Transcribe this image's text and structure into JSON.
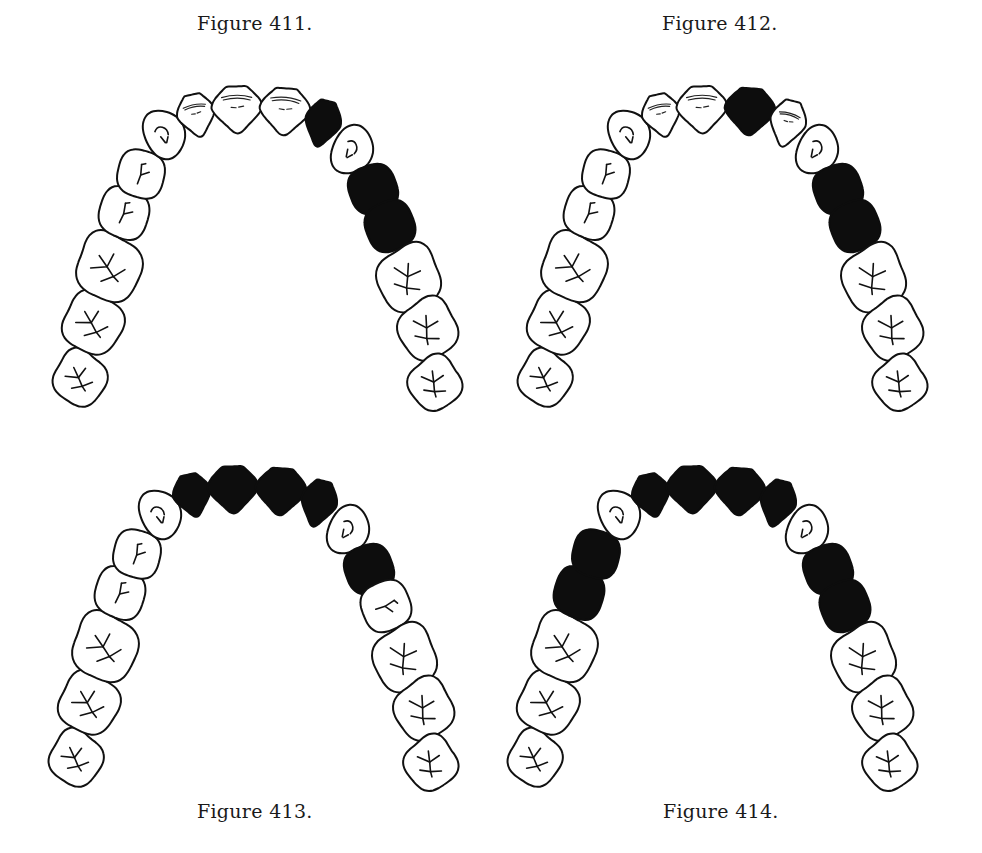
{
  "figures": [
    {
      "id": "fig411",
      "caption": "Figure 411.",
      "caption_pos": {
        "x": 197,
        "y": 12
      },
      "offset": {
        "x": 0,
        "y": 0
      },
      "filled": [
        "R-lateral",
        "R-pm1",
        "R-pm2"
      ]
    },
    {
      "id": "fig412",
      "caption": "Figure 412.",
      "caption_pos": {
        "x": 662,
        "y": 12
      },
      "offset": {
        "x": 465,
        "y": 0
      },
      "filled": [
        "R-central",
        "R-pm1",
        "R-pm2"
      ]
    },
    {
      "id": "fig413",
      "caption": "Figure 413.",
      "caption_pos": {
        "x": 197,
        "y": 800
      },
      "offset": {
        "x": -4,
        "y": 380
      },
      "filled": [
        "L-lateral",
        "L-central",
        "R-central",
        "R-lateral",
        "R-pm1"
      ]
    },
    {
      "id": "fig414",
      "caption": "Figure 414.",
      "caption_pos": {
        "x": 663,
        "y": 800
      },
      "offset": {
        "x": 455,
        "y": 380
      },
      "filled": [
        "L-lateral",
        "L-central",
        "R-central",
        "R-lateral",
        "L-pm1",
        "L-pm2",
        "R-pm1",
        "R-pm2"
      ]
    }
  ],
  "tooth_layout": [
    {
      "id": "L-m3",
      "type": "molar",
      "cx": 80,
      "cy": 378,
      "rx": 26,
      "ry": 28,
      "rot": -10
    },
    {
      "id": "L-m2",
      "type": "molar",
      "cx": 93,
      "cy": 323,
      "rx": 30,
      "ry": 31,
      "rot": -15
    },
    {
      "id": "L-m1",
      "type": "molar",
      "cx": 109,
      "cy": 267,
      "rx": 32,
      "ry": 35,
      "rot": -20
    },
    {
      "id": "L-pm2",
      "type": "premolar",
      "cx": 124,
      "cy": 213,
      "rx": 25,
      "ry": 27,
      "rot": -25
    },
    {
      "id": "L-pm1",
      "type": "premolar",
      "cx": 141,
      "cy": 174,
      "rx": 24,
      "ry": 25,
      "rot": -30
    },
    {
      "id": "L-canine",
      "type": "canine",
      "cx": 164,
      "cy": 134,
      "rx": 20,
      "ry": 25,
      "rot": -25
    },
    {
      "id": "L-lateral",
      "type": "incisor",
      "cx": 196,
      "cy": 114,
      "rx": 18,
      "ry": 22,
      "rot": -12
    },
    {
      "id": "L-central",
      "type": "incisor",
      "cx": 237,
      "cy": 108,
      "rx": 24,
      "ry": 24,
      "rot": -2
    },
    {
      "id": "R-central",
      "type": "incisor",
      "cx": 285,
      "cy": 110,
      "rx": 24,
      "ry": 24,
      "rot": 4
    },
    {
      "id": "R-lateral",
      "type": "incisor",
      "cx": 323,
      "cy": 122,
      "rx": 17,
      "ry": 24,
      "rot": 14
    },
    {
      "id": "R-canine",
      "type": "canine",
      "cx": 352,
      "cy": 150,
      "rx": 20,
      "ry": 25,
      "rot": 25
    },
    {
      "id": "R-pm1",
      "type": "premolar",
      "cx": 373,
      "cy": 189,
      "rx": 25,
      "ry": 25,
      "rot": 25
    },
    {
      "id": "R-pm2",
      "type": "premolar",
      "cx": 390,
      "cy": 226,
      "rx": 25,
      "ry": 26,
      "rot": 22
    },
    {
      "id": "R-m1",
      "type": "molar",
      "cx": 409,
      "cy": 278,
      "rx": 31,
      "ry": 34,
      "rot": 18
    },
    {
      "id": "R-m2",
      "type": "molar",
      "cx": 428,
      "cy": 329,
      "rx": 29,
      "ry": 31,
      "rot": 12
    },
    {
      "id": "R-m3",
      "type": "molar",
      "cx": 435,
      "cy": 383,
      "rx": 26,
      "ry": 27,
      "rot": 8
    }
  ],
  "colors": {
    "background": "#ffffff",
    "outline": "#111111",
    "filled": "#0d0d0d"
  }
}
